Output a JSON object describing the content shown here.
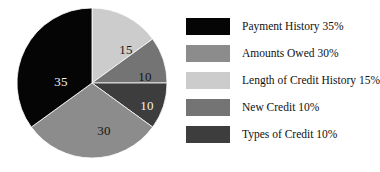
{
  "chart_data": {
    "type": "pie",
    "title": "",
    "subtitle": "",
    "xlabel": "",
    "ylabel": "",
    "legend_position": "right",
    "grid": false,
    "start_angle_deg": 0,
    "direction": "clockwise",
    "categories": [
      "Payment History",
      "Amounts Owed",
      "Length of Credit History",
      "New Credit",
      "Types of Credit"
    ],
    "values": [
      35,
      30,
      15,
      10,
      10
    ],
    "units": "percent",
    "colors": [
      "#050505",
      "#8c8c8c",
      "#cccccc",
      "#747474",
      "#3d3d3d"
    ],
    "slices": [
      {
        "label": "Length of Credit History",
        "value": 15,
        "data_label": "15",
        "color": "#cccccc",
        "label_color": "#1a1a1a",
        "start_deg": 0,
        "end_deg": 54,
        "label_x": 110,
        "label_y": 44
      },
      {
        "label": "New Credit",
        "value": 10,
        "data_label": "10",
        "color": "#747474",
        "label_color": "#141414",
        "start_deg": 54,
        "end_deg": 90,
        "label_x": 129,
        "label_y": 71
      },
      {
        "label": "Types of Credit",
        "value": 10,
        "data_label": "10",
        "color": "#3d3d3d",
        "label_color": "#f2f2f2",
        "start_deg": 90,
        "end_deg": 126,
        "label_x": 131,
        "label_y": 100
      },
      {
        "label": "Amounts Owed",
        "value": 30,
        "data_label": "30",
        "color": "#8c8c8c",
        "label_color": "#141414",
        "start_deg": 126,
        "end_deg": 234,
        "label_x": 88,
        "label_y": 125
      },
      {
        "label": "Payment History",
        "value": 35,
        "data_label": "35",
        "color": "#050505",
        "label_color": "#f5f5f5",
        "start_deg": 234,
        "end_deg": 360,
        "label_x": 45,
        "label_y": 76
      }
    ]
  },
  "legend": {
    "items": [
      {
        "label": "Payment History 35%",
        "color": "#050505",
        "swatch_name": "legend-swatch-payment-history"
      },
      {
        "label": "Amounts Owed 30%",
        "color": "#8c8c8c",
        "swatch_name": "legend-swatch-amounts-owed"
      },
      {
        "label": "Length of Credit History 15%",
        "color": "#cccccc",
        "swatch_name": "legend-swatch-length-of-credit-history"
      },
      {
        "label": "New Credit 10%",
        "color": "#747474",
        "swatch_name": "legend-swatch-new-credit"
      },
      {
        "label": "Types of Credit 10%",
        "color": "#3d3d3d",
        "swatch_name": "legend-swatch-types-of-credit"
      }
    ]
  }
}
